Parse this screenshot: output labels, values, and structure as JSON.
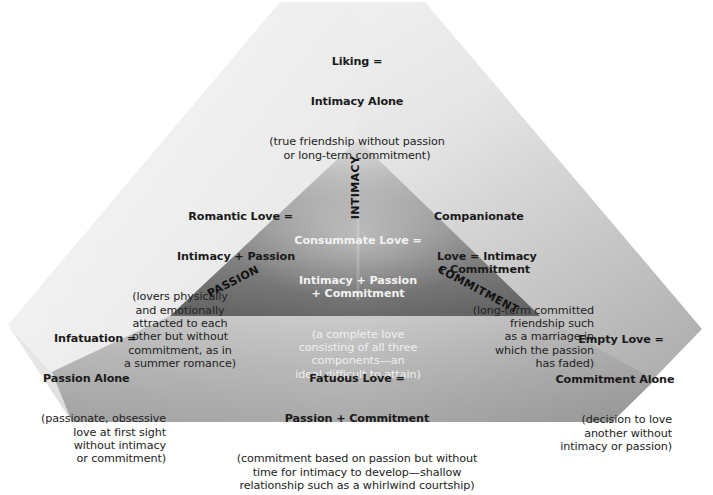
{
  "diagram": {
    "colors": {
      "outer_light": "#f2f2f2",
      "outer_mid": "#c9c9c9",
      "outer_dark": "#a8a8a8",
      "bottom_band_light": "#cfcfcf",
      "bottom_band_dark": "#9a9a9a",
      "inner_top": "#d8d8d8",
      "inner_bottom": "#6a6a6a"
    },
    "axes": {
      "intimacy": "INTIMACY",
      "passion": "PASSION",
      "commitment": "COMMITMENT"
    },
    "types": {
      "liking": {
        "title_line1": "Liking =",
        "title_line2": "Intimacy Alone",
        "desc": "(true friendship without passion\nor long-term commitment)"
      },
      "romantic": {
        "title_line1": "Romantic Love =",
        "title_line2": "Intimacy + Passion",
        "desc": "(lovers physically\nand emotionally\nattracted to each\nother but without\ncommitment, as in\na summer romance)"
      },
      "companionate": {
        "title_line1": "Companionate",
        "title_line2": "Love = Intimacy\n+ Commitment",
        "desc": "(long-term committed\nfriendship such\nas a marriage in\nwhich the passion\nhas faded)"
      },
      "consummate": {
        "title_line1": "Consummate Love =",
        "title_line2": "Intimacy + Passion\n+ Commitment",
        "desc": "(a complete love\nconsisting of all three\ncomponents—an\nideal difficult to attain)"
      },
      "infatuation": {
        "title_line1": "Infatuation =",
        "title_line2": "Passion Alone",
        "desc": "(passionate, obsessive\nlove at first sight\nwithout intimacy\nor commitment)"
      },
      "empty": {
        "title_line1": "Empty Love =",
        "title_line2": "Commitment Alone",
        "desc": "(decision to love\nanother without\nintimacy or passion)"
      },
      "fatuous": {
        "title_line1": "Fatuous Love =",
        "title_line2": "Passion + Commitment",
        "desc": "(commitment based on passion but without\ntime for intimacy to develop—shallow\nrelationship such as a whirlwind courtship)"
      }
    }
  }
}
